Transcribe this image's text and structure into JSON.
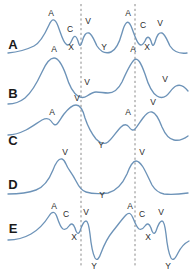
{
  "figure": {
    "width": 194,
    "height": 270,
    "background": "#ffffff",
    "wave_color": "#6d93b8",
    "guide_color": "#8a8a8a",
    "label_color": "#2b2b2b",
    "row_label_color": "#1a1a1a"
  },
  "guides": [
    {
      "name": "guide-line-1",
      "x": 81
    },
    {
      "name": "guide-line-2",
      "x": 135
    }
  ],
  "rows": [
    {
      "id": "A",
      "label": "A",
      "label_x": 13,
      "label_y": 44,
      "path": "M 8,53 C 18,52 26,50 34,46 C 40,43 44,36 49,25 C 52,18 55,18 58,26 C 61,34 63,42 66,44 C 68,46 70,45 72,40 C 74,35 76,35 78,41 C 79,45 80,48 82,42 C 84,35 86,32 89,33 C 92,34 94,40 97,46 C 101,52 106,54 111,52 C 116,50 119,44 122,33 C 125,22 128,19 131,26 C 134,33 136,41 139,44 C 141,46 143,45 145,41 C 147,36 149,36 151,41 C 152,45 153,48 155,42 C 157,35 159,32 162,33 C 165,34 167,40 170,46 C 174,52 180,54 187,53",
      "labels": [
        {
          "name": "wave-label-a1",
          "text": "A",
          "x": 51,
          "y": 13
        },
        {
          "name": "wave-label-c1",
          "text": "C",
          "x": 70,
          "y": 29
        },
        {
          "name": "wave-label-v1",
          "text": "V",
          "x": 88,
          "y": 21
        },
        {
          "name": "wave-label-x1",
          "text": "X",
          "x": 71,
          "y": 47
        },
        {
          "name": "wave-label-y1",
          "text": "Y",
          "x": 104,
          "y": 47
        },
        {
          "name": "wave-label-a2",
          "text": "A",
          "x": 128,
          "y": 13
        },
        {
          "name": "wave-label-c2",
          "text": "C",
          "x": 143,
          "y": 25
        },
        {
          "name": "wave-label-v2",
          "text": "V",
          "x": 160,
          "y": 23
        },
        {
          "name": "wave-label-x2",
          "text": "X",
          "x": 147,
          "y": 47
        }
      ]
    },
    {
      "id": "B",
      "label": "B",
      "label_x": 13,
      "label_y": 93,
      "path": "M 8,104 C 14,104 20,102 25,98 C 31,93 36,85 42,72 C 46,63 50,58 54,58 C 58,58 62,64 66,75 C 69,85 73,93 78,96 C 81,98 84,98 87,96 C 90,94 93,92 96,92 C 100,92 104,93 108,93 C 113,93 118,90 122,82 C 126,73 130,64 134,60 C 138,57 141,63 145,74 C 148,84 152,93 157,96 C 160,98 163,98 166,96 C 169,94 172,88 176,86 C 180,84 184,86 188,91",
      "labels": [
        {
          "name": "wave-label-a1",
          "text": "A",
          "x": 54,
          "y": 49
        },
        {
          "name": "wave-label-v1",
          "text": "V",
          "x": 87,
          "y": 82
        },
        {
          "name": "wave-label-a2",
          "text": "A",
          "x": 133,
          "y": 49
        },
        {
          "name": "wave-label-v2",
          "text": "V",
          "x": 165,
          "y": 79
        }
      ]
    },
    {
      "id": "C",
      "label": "C",
      "label_x": 13,
      "label_y": 140,
      "path": "M 8,135 C 14,135 20,133 26,130 C 32,127 37,123 42,120 C 46,118 49,118 51,121 C 53,124 55,126 57,124 C 59,122 61,118 64,114 C 68,109 72,105 76,105 C 80,105 83,110 85,118 C 88,127 92,134 96,139 C 100,143 104,145 108,142 C 112,139 116,132 121,127 C 124,124 127,124 129,127 C 131,130 133,131 135,129 C 137,127 140,122 143,118 C 146,114 149,111 152,112 C 156,113 159,119 162,127 C 165,134 169,139 174,140 C 179,141 184,139 188,136",
      "labels": [
        {
          "name": "wave-label-a1",
          "text": "A",
          "x": 52,
          "y": 112
        },
        {
          "name": "wave-label-v1",
          "text": "V",
          "x": 77,
          "y": 98
        },
        {
          "name": "wave-label-y1",
          "text": "Y",
          "x": 101,
          "y": 145
        },
        {
          "name": "wave-label-a2",
          "text": "A",
          "x": 128,
          "y": 112
        },
        {
          "name": "wave-label-v2",
          "text": "V",
          "x": 153,
          "y": 102
        }
      ]
    },
    {
      "id": "D",
      "label": "D",
      "label_x": 13,
      "label_y": 184,
      "path": "M 8,194 C 18,194 28,193 36,190 C 44,187 49,180 53,170 C 56,162 59,158 62,159 C 65,160 66,165 68,168 C 70,171 73,175 76,181 C 79,187 82,191 86,192 C 92,194 100,194 108,193 C 116,191 122,185 127,174 C 130,166 133,161 136,161 C 139,161 141,164 143,167 C 146,172 149,179 152,185 C 155,190 159,193 164,194 C 172,195 181,194 188,193",
      "labels": [
        {
          "name": "wave-label-v1",
          "text": "V",
          "x": 65,
          "y": 152
        },
        {
          "name": "wave-label-y1",
          "text": "Y",
          "x": 102,
          "y": 195
        },
        {
          "name": "wave-label-v2",
          "text": "V",
          "x": 142,
          "y": 152
        }
      ]
    },
    {
      "id": "E",
      "label": "E",
      "label_x": 13,
      "label_y": 228,
      "path": "M 8,240 C 16,240 24,238 31,234 C 38,230 44,224 49,216 C 52,211 55,211 57,217 C 59,223 61,228 63,229 C 65,230 67,229 69,226 C 71,223 73,223 75,228 C 76,232 78,236 80,231 C 82,225 84,221 86,221 C 88,221 89,226 90,234 C 91,244 93,254 95,258 C 97,261 99,259 101,253 C 104,245 108,237 113,231 C 118,225 122,219 126,215 C 129,212 131,213 133,218 C 135,223 137,228 139,229 C 141,230 143,229 145,226 C 147,223 149,223 151,228 C 152,232 154,236 156,231 C 158,225 160,221 162,221 C 164,221 165,226 166,234 C 167,244 169,254 171,258 C 173,261 175,259 178,253 C 181,247 185,243 189,241",
      "labels": [
        {
          "name": "wave-label-a1",
          "text": "A",
          "x": 54,
          "y": 206
        },
        {
          "name": "wave-label-c1",
          "text": "C",
          "x": 66,
          "y": 214
        },
        {
          "name": "wave-label-v1",
          "text": "V",
          "x": 86,
          "y": 212
        },
        {
          "name": "wave-label-x1",
          "text": "X",
          "x": 74,
          "y": 237
        },
        {
          "name": "wave-label-y1",
          "text": "Y",
          "x": 94,
          "y": 266
        },
        {
          "name": "wave-label-a2",
          "text": "A",
          "x": 130,
          "y": 206
        },
        {
          "name": "wave-label-c2",
          "text": "C",
          "x": 142,
          "y": 214
        },
        {
          "name": "wave-label-v2",
          "text": "V",
          "x": 161,
          "y": 212
        },
        {
          "name": "wave-label-x2",
          "text": "X",
          "x": 148,
          "y": 237
        },
        {
          "name": "wave-label-y2",
          "text": "Y",
          "x": 168,
          "y": 266
        }
      ]
    }
  ]
}
